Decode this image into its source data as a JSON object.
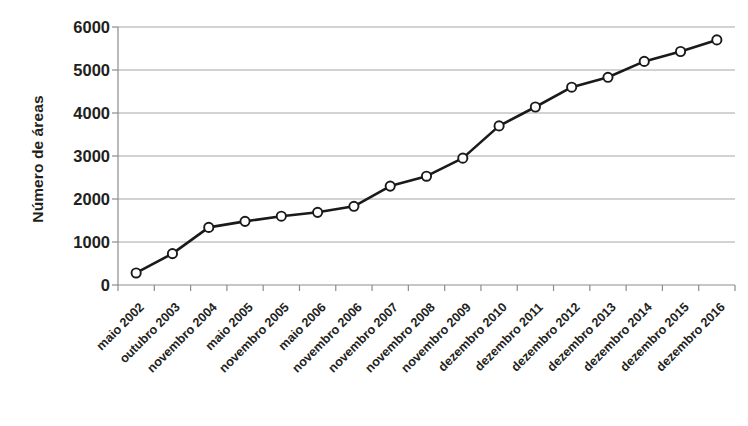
{
  "chart_data": {
    "type": "line",
    "title": "",
    "subtitle": "",
    "xlabel": "",
    "ylabel": "Número de áreas",
    "ylim": [
      0,
      6000
    ],
    "y_ticks": [
      0,
      1000,
      2000,
      3000,
      4000,
      5000,
      6000
    ],
    "y_tick_labels": [
      "0",
      "1000",
      "2000",
      "3000",
      "4000",
      "5000",
      "6000"
    ],
    "grid": "horizontal",
    "legend": "none",
    "marker": "open-circle",
    "line_color": "#1a1a1a",
    "marker_fill": "#ffffff",
    "marker_edge": "#1a1a1a",
    "grid_color": "#a6a6a6",
    "axis_color": "#8c8c8c",
    "categories": [
      "maio 2002",
      "outubro 2003",
      "novembro 2004",
      "maio 2005",
      "novembro 2005",
      "maio 2006",
      "novembro 2006",
      "novembro 2007",
      "novembro 2008",
      "novembro 2009",
      "dezembro 2010",
      "dezembro 2011",
      "dezembro 2012",
      "dezembro 2013",
      "dezembro 2014",
      "dezembro 2015",
      "dezembro 2016"
    ],
    "values": [
      280,
      730,
      1340,
      1480,
      1600,
      1690,
      1830,
      2300,
      2530,
      2950,
      3700,
      4140,
      4600,
      4830,
      5200,
      5430,
      5700
    ]
  },
  "caption": ""
}
